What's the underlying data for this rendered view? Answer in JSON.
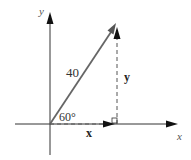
{
  "diagram": {
    "type": "vector-components",
    "axes": {
      "x_label": "x",
      "y_label": "y"
    },
    "vector": {
      "magnitude_label": "40",
      "angle_label": "60°"
    },
    "components": {
      "x_label": "x",
      "y_label": "y"
    },
    "colors": {
      "axis": "#333333",
      "vector": "#666666",
      "dashed": "#555555"
    }
  }
}
